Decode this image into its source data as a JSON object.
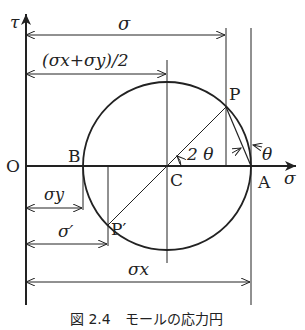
{
  "figure": {
    "caption": "図 2.4　モールの応力円",
    "axes": {
      "vertical": "τ",
      "horizontal": "σ",
      "origin": "O"
    },
    "points": {
      "A": "A",
      "B": "B",
      "C": "C",
      "P": "P",
      "P_prime": "P′"
    },
    "dimensions": {
      "sigma": "σ",
      "mean": "(σx+σy)/2",
      "sigma_y": "σy",
      "sigma_prime": "σ′",
      "sigma_x": "σx"
    },
    "angles": {
      "two_theta": "2 θ",
      "theta": "θ"
    },
    "colors": {
      "line": "#222222",
      "background": "#ffffff"
    }
  }
}
